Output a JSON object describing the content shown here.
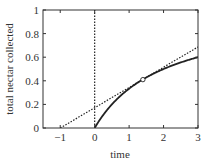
{
  "chart_data": {
    "type": "line",
    "title": "",
    "xlabel": "time",
    "ylabel": "total nectar collected",
    "xlim": [
      -1.5,
      3
    ],
    "ylim": [
      0,
      1
    ],
    "xticks": [
      -1,
      0,
      1,
      2,
      3
    ],
    "xtick_labels": [
      "−1",
      "0",
      "1",
      "2",
      "3"
    ],
    "yticks": [
      0,
      0.2,
      0.4,
      0.6,
      0.8,
      1
    ],
    "ytick_labels": [
      "0",
      "0.2",
      "0.4",
      "0.6",
      "0.8",
      "1"
    ],
    "grid": false,
    "legend": null,
    "series": [
      {
        "name": "gain curve",
        "style": "solid",
        "x": [
          0,
          0.25,
          0.5,
          0.75,
          1,
          1.25,
          1.5,
          1.75,
          2,
          2.25,
          2.5,
          2.75,
          3
        ],
        "values": [
          0,
          0.111,
          0.2,
          0.273,
          0.333,
          0.385,
          0.429,
          0.467,
          0.5,
          0.529,
          0.556,
          0.579,
          0.6
        ]
      },
      {
        "name": "tangent line",
        "style": "dotted",
        "x": [
          -1,
          3
        ],
        "values": [
          0,
          0.687
        ]
      },
      {
        "name": "vertical line at t=0",
        "style": "dotted",
        "x": [
          0,
          0
        ],
        "values": [
          0,
          1
        ]
      }
    ],
    "annotations": [
      {
        "type": "open-circle",
        "x": 1.4,
        "y": 0.41,
        "label": "tangent point"
      }
    ]
  }
}
